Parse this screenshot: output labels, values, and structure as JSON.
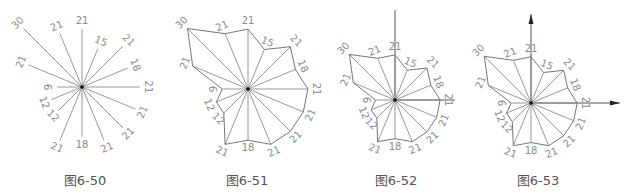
{
  "directions": [
    "N",
    "NNE",
    "NE",
    "ENE",
    "E",
    "ESE",
    "SE",
    "SSE",
    "S",
    "SSW",
    "SW",
    "WSW",
    "W",
    "WNW",
    "NW",
    "NNW"
  ],
  "values": [
    21,
    15,
    21,
    18,
    21,
    21,
    21,
    21,
    18,
    21,
    12,
    12,
    9,
    21,
    30,
    21
  ],
  "colors": {
    "line": "#8c8c8c",
    "axis": "#555555",
    "label": "#8a8a8a",
    "caption": "#555555",
    "center": "#111111"
  },
  "figures": [
    {
      "id": "fig-6-50",
      "caption": "图6-50",
      "cx": 82,
      "cy": 87,
      "scale": 2.75,
      "polygon": false,
      "axes": "none",
      "caption_x": 85
    },
    {
      "id": "fig-6-51",
      "caption": "图6-51",
      "cx": 248,
      "cy": 89,
      "scale": 2.85,
      "polygon": true,
      "axes": "none",
      "caption_x": 247
    },
    {
      "id": "fig-6-52",
      "caption": "图6-52",
      "cx": 395,
      "cy": 100,
      "scale": 2.15,
      "polygon": true,
      "axes": "lines",
      "caption_x": 396,
      "axis_top": 10,
      "axis_right": 455
    },
    {
      "id": "fig-6-53",
      "caption": "图6-53",
      "cx": 531,
      "cy": 103,
      "scale": 2.2,
      "polygon": true,
      "axes": "arrows",
      "caption_x": 538,
      "axis_top": 14,
      "axis_right": 620
    }
  ]
}
